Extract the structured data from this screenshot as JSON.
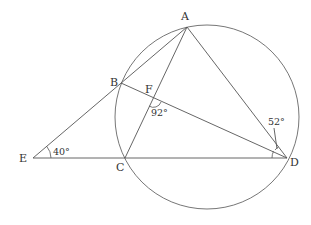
{
  "diagram": {
    "points": {
      "A": {
        "label": "A",
        "x": 187,
        "y": 27
      },
      "B": {
        "label": "B",
        "x": 121,
        "y": 83
      },
      "C": {
        "label": "C",
        "x": 125,
        "y": 158
      },
      "D": {
        "label": "D",
        "x": 287,
        "y": 158
      },
      "E": {
        "label": "E",
        "x": 33,
        "y": 158
      },
      "F": {
        "label": "F",
        "x": 153,
        "y": 98
      }
    },
    "circle": {
      "cx": 207,
      "cy": 117,
      "r": 92
    },
    "segments": [
      "EA",
      "ED",
      "AC",
      "AD",
      "AB",
      "BD"
    ],
    "angles": {
      "E": {
        "value": "40°"
      },
      "F": {
        "value": "92°"
      },
      "D": {
        "value": "52°"
      }
    },
    "stroke_color": "#555555",
    "background": "#ffffff"
  }
}
